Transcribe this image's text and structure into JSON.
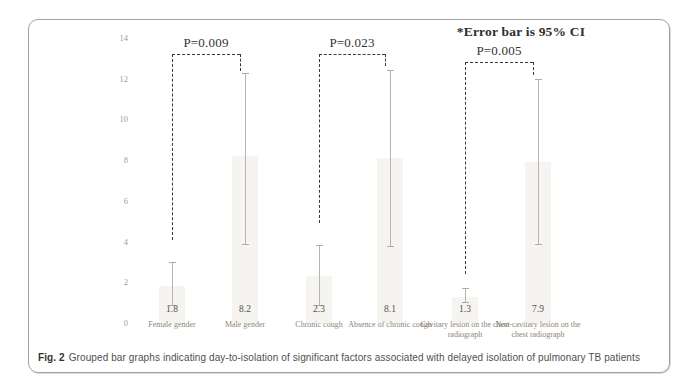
{
  "figure": {
    "annotation": "*Error bar is 95% CI",
    "caption_label": "Fig. 2",
    "caption_text": "Grouped bar graphs indicating day-to-isolation of significant factors associated with delayed isolation of pulmonary TB patients"
  },
  "chart_data": {
    "type": "bar",
    "title": "",
    "xlabel": "",
    "ylabel": "",
    "ylim": [
      0,
      14
    ],
    "yticks": [
      0,
      2,
      4,
      6,
      8,
      10,
      12,
      14
    ],
    "grid": false,
    "legend": "none",
    "categories": [
      "Female gender",
      "Male gender",
      "Chronic cough",
      "Absence of chronic cough",
      "Cavitary lesion on the chest radiograph",
      "Non-cavitary lesion on the chest radiograph"
    ],
    "values": [
      1.8,
      8.2,
      2.3,
      8.1,
      1.3,
      7.9
    ],
    "value_labels": [
      "1.8",
      "8.2",
      "2.3",
      "8.1",
      "1.3",
      "7.9"
    ],
    "error_bars_95ci": [
      [
        0.9,
        3.0
      ],
      [
        3.9,
        12.3
      ],
      [
        0.9,
        3.85
      ],
      [
        3.8,
        12.45
      ],
      [
        1.05,
        1.7
      ],
      [
        3.9,
        12.0
      ]
    ],
    "comparisons": [
      {
        "label": "P=0.009",
        "between": [
          "Female gender",
          "Male gender"
        ],
        "bar_top": 13.2,
        "left_drop_to": 4.1,
        "right_drop_to": 12.4
      },
      {
        "label": "P=0.023",
        "between": [
          "Chronic cough",
          "Absence of chronic cough"
        ],
        "bar_top": 13.2,
        "left_drop_to": 4.9,
        "right_drop_to": 12.6
      },
      {
        "label": "P=0.005",
        "between": [
          "Cavitary lesion on the chest radiograph",
          "Non-cavitary lesion on the chest radiograph"
        ],
        "bar_top": 12.8,
        "left_drop_to": 2.4,
        "right_drop_to": 12.2
      }
    ],
    "colors": {
      "bar_fill": "#f6f4f1",
      "error_bar": "#b9b5ae",
      "bracket": "#3a3a3a",
      "tick_label": "#a39d92",
      "value_label": "#57524a",
      "category_label": "#8d8478",
      "annotation_text": "#2e2e2e",
      "border": "#a3a3a3"
    }
  }
}
